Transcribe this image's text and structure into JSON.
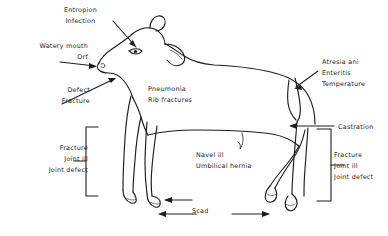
{
  "diagram": {
    "stroke_color": "#1d1d1d",
    "background_color": "#fefefe",
    "labels": {
      "entropion": {
        "lines": [
          "Entropion",
          "Infection"
        ],
        "align": "center"
      },
      "watery_mouth": {
        "lines": [
          "Watery mouth",
          "Orf"
        ],
        "align": "right"
      },
      "defect": {
        "lines": [
          "Defect",
          "Fracture"
        ],
        "align": "right"
      },
      "pneumonia": {
        "lines": [
          "Pneumonia",
          "Rib  fractures"
        ],
        "align": "left"
      },
      "atresia": {
        "lines": [
          "Atresia  ani",
          "Enteritis",
          "Temperature"
        ],
        "align": "left"
      },
      "castration": {
        "lines": [
          "Castration"
        ],
        "align": "left"
      },
      "navel": {
        "lines": [
          "Navel  ill",
          "Umbilical  hernia"
        ],
        "align": "left"
      },
      "fracture_left": {
        "lines": [
          "Fracture",
          "Joint  ill",
          "Joint defect"
        ],
        "align": "right"
      },
      "fracture_right": {
        "lines": [
          "Fracture",
          "Joint ill",
          "Joint defect"
        ],
        "align": "left"
      },
      "scad": {
        "lines": [
          "Scad"
        ],
        "align": "center"
      }
    }
  }
}
